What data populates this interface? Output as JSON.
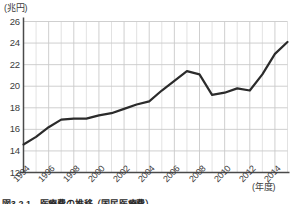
{
  "figure": {
    "unit_label": "(兆円)",
    "xaxis_title": "(年度)",
    "caption": "図3-2-1　医療費の推移（国民医療費）"
  },
  "chart_data": {
    "type": "line",
    "title": "",
    "xlabel": "(年度)",
    "ylabel": "(兆円)",
    "xlim": [
      1994,
      2015
    ],
    "ylim": [
      12,
      26
    ],
    "ytick_step": 2,
    "grid": true,
    "legend": "none",
    "line_color": "#2b2b2b",
    "grid_color": "#c9c9c9",
    "axis_color": "#4a4a4a",
    "yticks": [
      12,
      14,
      16,
      18,
      20,
      22,
      24,
      26
    ],
    "xticks": [
      1994,
      1996,
      1998,
      2000,
      2002,
      2004,
      2006,
      2008,
      2010,
      2012,
      2014
    ],
    "x": [
      1994,
      1995,
      1996,
      1997,
      1998,
      1999,
      2000,
      2001,
      2002,
      2003,
      2004,
      2005,
      2006,
      2007,
      2008,
      2009,
      2010,
      2011,
      2012,
      2013,
      2014,
      2015
    ],
    "values": [
      14.6,
      15.3,
      16.2,
      16.9,
      17.0,
      17.0,
      17.3,
      17.5,
      17.9,
      18.3,
      18.6,
      19.6,
      20.5,
      21.4,
      21.1,
      19.2,
      19.4,
      19.8,
      19.6,
      21.1,
      23.0,
      24.1
    ]
  }
}
